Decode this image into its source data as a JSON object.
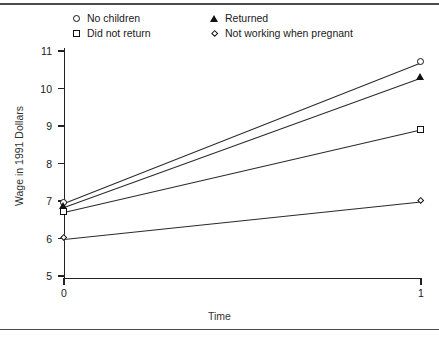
{
  "chart_data": {
    "type": "line",
    "title": "",
    "xlabel": "Time",
    "ylabel": "Wage in 1991 Dollars",
    "x": [
      0,
      1
    ],
    "xlim": [
      0,
      1
    ],
    "ylim": [
      5,
      11
    ],
    "xticks": [
      0,
      1
    ],
    "xtick_labels": [
      "0",
      "1"
    ],
    "yticks": [
      5,
      6,
      7,
      8,
      9,
      10,
      11
    ],
    "ytick_labels": [
      "5",
      "6",
      "7",
      "8",
      "9",
      "10",
      "11"
    ],
    "grid": false,
    "legend_position": "above-plot",
    "series": [
      {
        "name": "No children",
        "marker": "circle",
        "values": [
          6.95,
          10.7
        ]
      },
      {
        "name": "Did not return",
        "marker": "square",
        "values": [
          6.7,
          8.9
        ]
      },
      {
        "name": "Returned",
        "marker": "triangle",
        "values": [
          6.85,
          10.3
        ]
      },
      {
        "name": "Not working when pregnant",
        "marker": "diamond",
        "values": [
          6.0,
          7.0
        ]
      }
    ]
  },
  "legend": {
    "items": [
      {
        "label": "No children",
        "marker": "circle"
      },
      {
        "label": "Did not return",
        "marker": "square"
      },
      {
        "label": "Returned",
        "marker": "triangle"
      },
      {
        "label": "Not working when pregnant",
        "marker": "diamond"
      }
    ]
  },
  "axes": {
    "xlabel": "Time",
    "ylabel": "Wage in 1991 Dollars",
    "xtick_labels": [
      "0",
      "1"
    ],
    "ytick_labels": [
      "11",
      "10",
      "9",
      "8",
      "7",
      "6",
      "5"
    ]
  },
  "colors": {
    "ink": "#1a1a1a",
    "line": "#2a2a2a",
    "background": "#ffffff",
    "rule": "#4a4a4a"
  }
}
